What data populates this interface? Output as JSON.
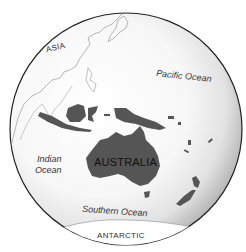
{
  "map": {
    "title": "Australia and surrounding region (globe view)",
    "colors": {
      "land_highlight": "#555555",
      "outline": "#888888",
      "globe_edge": "#222222",
      "ocean_light": "#ffffff",
      "ocean_shade": "#bdbdbd"
    },
    "labels": {
      "asia": "ASIA",
      "pacific": "Pacific Ocean",
      "indian_line1": "Indian",
      "indian_line2": "Ocean",
      "australia": "AUSTRALIA",
      "southern": "Southern Ocean",
      "antarctic": "ANTARCTIC"
    }
  }
}
